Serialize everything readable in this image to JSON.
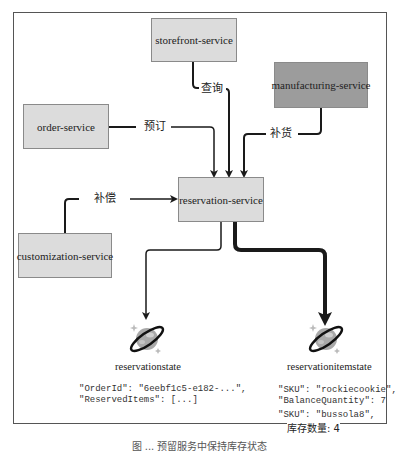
{
  "diagram": {
    "services": {
      "storefront": "storefront-service",
      "manufacturing": "manufacturing-service",
      "order": "order-service",
      "reservation": "reservation-service",
      "customization": "customization-service"
    },
    "edges": {
      "query": "查询",
      "reserve": "预订",
      "replenish": "补货",
      "compensate": "补偿"
    },
    "stores": [
      {
        "name": "reservationstate",
        "icon": "cosmos-db-icon",
        "lines": [
          "\"OrderId\": \"6eebf1c5-e182-...\",",
          "\"ReservedItems\": [...]"
        ]
      },
      {
        "name": "reservationitemstate",
        "icon": "cosmos-db-icon",
        "lines": [
          "\"SKU\": \"rockiecookie\",",
          "\"BalanceQuantity\": 7"
        ],
        "lines2": [
          "\"SKU\": \"bussola8\","
        ],
        "cjk_line": "库存数量: 4"
      }
    ],
    "caption": "图 ... 预留服务中保持库存状态"
  },
  "colors": {
    "light_box": "#dcdcdc",
    "dark_box": "#9c9c9c",
    "line": "#1a1a1a"
  }
}
